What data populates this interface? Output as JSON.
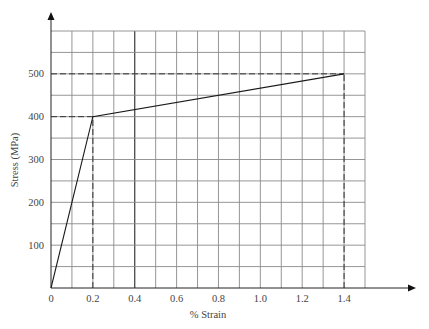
{
  "chart_data": {
    "type": "line",
    "title": "",
    "xlabel": "% Strain",
    "ylabel": "Stress (MPa)",
    "xlim": [
      0,
      1.5
    ],
    "ylim": [
      0,
      600
    ],
    "grid": true,
    "x_ticks": [
      {
        "value": 0,
        "label": "0"
      },
      {
        "value": 0.2,
        "label": "0.2"
      },
      {
        "value": 0.4,
        "label": "0.4"
      },
      {
        "value": 0.6,
        "label": "0.6"
      },
      {
        "value": 0.8,
        "label": "0.8"
      },
      {
        "value": 1.0,
        "label": "1.0"
      },
      {
        "value": 1.2,
        "label": "1.2"
      },
      {
        "value": 1.4,
        "label": "1.4"
      }
    ],
    "y_ticks": [
      {
        "value": 100,
        "label": "100"
      },
      {
        "value": 200,
        "label": "200"
      },
      {
        "value": 300,
        "label": "300"
      },
      {
        "value": 400,
        "label": "400"
      },
      {
        "value": 500,
        "label": "500"
      }
    ],
    "grid_x_step": 0.1,
    "grid_y_step": 50,
    "emphasized_vertical_line": 0.4,
    "series": [
      {
        "name": "Stress-strain curve",
        "x": [
          0,
          0.2,
          1.4
        ],
        "y": [
          0,
          400,
          500
        ]
      }
    ],
    "reference_lines": [
      {
        "type": "horizontal",
        "y": 400,
        "x_from": 0,
        "x_to": 0.2,
        "style": "dashed"
      },
      {
        "type": "vertical",
        "x": 0.2,
        "y_from": 0,
        "y_to": 400,
        "style": "dashed"
      },
      {
        "type": "horizontal",
        "y": 500,
        "x_from": 0,
        "x_to": 1.4,
        "style": "dashed"
      },
      {
        "type": "vertical",
        "x": 1.4,
        "y_from": 0,
        "y_to": 500,
        "style": "dashed"
      }
    ]
  }
}
